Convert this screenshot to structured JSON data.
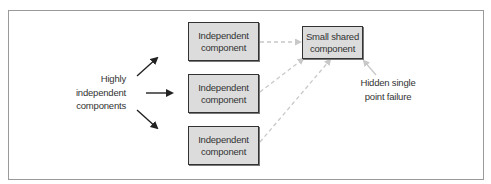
{
  "diagram": {
    "left_label": [
      "Highly",
      "independent",
      "components"
    ],
    "components": [
      {
        "label_line1": "Independent",
        "label_line2": "component"
      },
      {
        "label_line1": "Independent",
        "label_line2": "component"
      },
      {
        "label_line1": "Independent",
        "label_line2": "component"
      }
    ],
    "shared": {
      "label_line1": "Small shared",
      "label_line2": "component"
    },
    "annotation": [
      "Hidden single",
      "point failure"
    ],
    "colors": {
      "box_fill": "#dcdcdc",
      "box_border": "#333333",
      "dashed": "#c8c8c8",
      "arrow": "#222222"
    }
  }
}
